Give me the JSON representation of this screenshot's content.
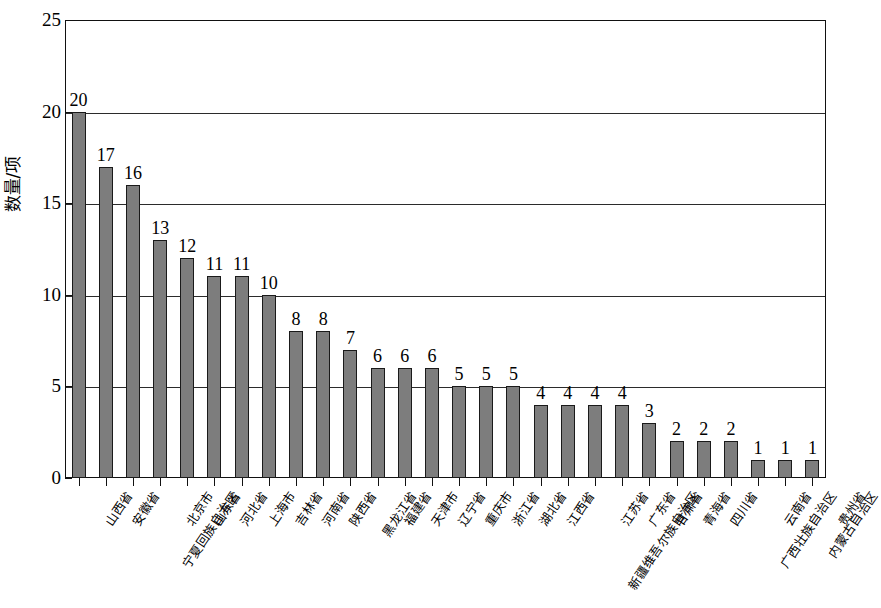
{
  "chart_data": {
    "type": "bar",
    "title": "",
    "xlabel": "",
    "ylabel": "数量/项",
    "ylim": [
      0,
      25
    ],
    "yticks": [
      0,
      5,
      10,
      15,
      20,
      25
    ],
    "ytick_labels": [
      "0",
      "5",
      "10",
      "15",
      "20",
      "25"
    ],
    "grid": true,
    "legend": null,
    "bar_color": "#7d7d7d",
    "bar_edge_color": "#1a1a1a",
    "categories": [
      "山西省",
      "安徽省",
      "宁夏回族自治区",
      "北京市",
      "山东省",
      "河北省",
      "上海市",
      "吉林省",
      "河南省",
      "陕西省",
      "黑龙江省",
      "福建省",
      "天津市",
      "辽宁省",
      "重庆市",
      "浙江省",
      "湖北省",
      "江西省",
      "新疆维吾尔族自治区",
      "江苏省",
      "广东省",
      "甘肃省",
      "青海省",
      "四川省",
      "广西壮族自治区",
      "云南省",
      "内蒙古自治区",
      "贵州省"
    ],
    "values": [
      20,
      17,
      16,
      13,
      12,
      11,
      11,
      10,
      8,
      8,
      7,
      6,
      6,
      6,
      5,
      5,
      5,
      4,
      4,
      4,
      4,
      3,
      2,
      2,
      2,
      1,
      1,
      1
    ],
    "value_labels": [
      "20",
      "17",
      "16",
      "13",
      "12",
      "11",
      "11",
      "10",
      "8",
      "8",
      "7",
      "6",
      "6",
      "6",
      "5",
      "5",
      "5",
      "4",
      "4",
      "4",
      "4",
      "3",
      "2",
      "2",
      "2",
      "1",
      "1",
      "1"
    ]
  }
}
